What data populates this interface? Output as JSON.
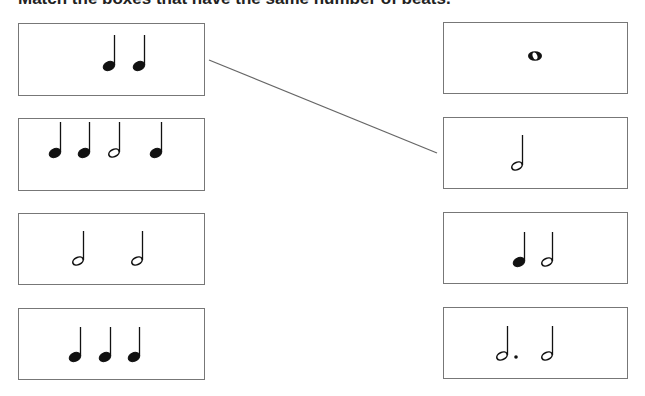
{
  "title": "Match the boxes that have the same number of beats.",
  "left_boxes": [
    {
      "id": "L1",
      "notes": [
        "quarter",
        "quarter"
      ],
      "beats": 2
    },
    {
      "id": "L2",
      "notes": [
        "quarter",
        "quarter",
        "half",
        "quarter"
      ],
      "beats": 5
    },
    {
      "id": "L3",
      "notes": [
        "half",
        "half"
      ],
      "beats": 4
    },
    {
      "id": "L4",
      "notes": [
        "quarter",
        "quarter",
        "quarter"
      ],
      "beats": 3
    }
  ],
  "right_boxes": [
    {
      "id": "R1",
      "notes": [
        "whole"
      ],
      "beats": 4
    },
    {
      "id": "R2",
      "notes": [
        "half"
      ],
      "beats": 2
    },
    {
      "id": "R3",
      "notes": [
        "quarter",
        "half"
      ],
      "beats": 3
    },
    {
      "id": "R4",
      "notes": [
        "dotted-half",
        "half"
      ],
      "beats": 5
    }
  ],
  "connections": [
    {
      "from": "L1",
      "to": "R2"
    }
  ],
  "colors": {
    "ink": "#111111",
    "border": "#777777",
    "line": "#666666"
  }
}
